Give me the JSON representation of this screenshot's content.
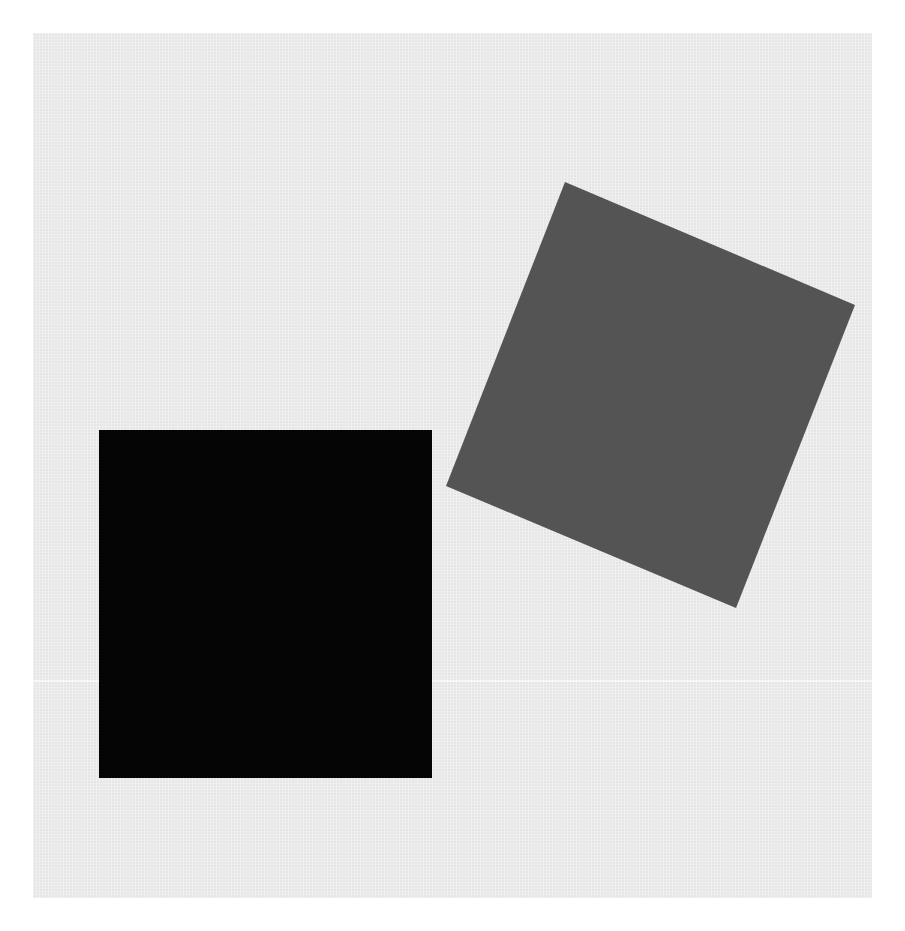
{
  "image": {
    "description": "Two squares on a light gray textured background: a black axis-aligned square at lower left and a dark gray rotated square at upper right.",
    "width": 905,
    "height": 931
  },
  "colors": {
    "border": "#ffffff",
    "background": "#e6e6e6",
    "black_square": "#050505",
    "gray_square": "#545454"
  },
  "panel": {
    "x": 33,
    "y": 33,
    "width": 839,
    "height": 865
  },
  "scan_line": {
    "y": 680
  },
  "shapes": {
    "black_square": {
      "x": 99,
      "y": 430,
      "width": 333,
      "height": 348
    },
    "gray_square": {
      "points": "565,182 855,305 736,608 446,486"
    }
  }
}
